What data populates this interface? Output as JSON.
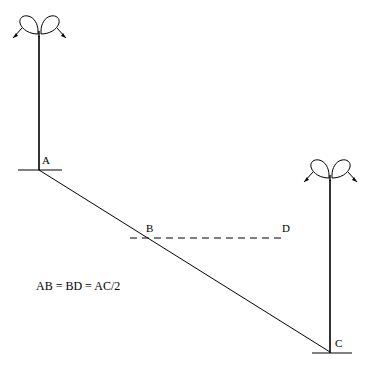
{
  "figure": {
    "type": "geometry-diagram",
    "background_color": "#ffffff",
    "stroke_color": "#000000",
    "equation": "AB = BD = AC/2",
    "points": [
      {
        "id": "A",
        "label": "A",
        "x": 39,
        "y": 169,
        "label_x": 42,
        "label_y": 160
      },
      {
        "id": "B",
        "label": "B",
        "x": 148,
        "y": 237,
        "label_x": 147,
        "label_y": 228
      },
      {
        "id": "C",
        "label": "C",
        "x": 330,
        "y": 352,
        "label_x": 334,
        "label_y": 343
      },
      {
        "id": "D",
        "label": "D",
        "x": 280,
        "y": 237,
        "label_x": 283,
        "label_y": 228
      }
    ],
    "segments": [
      {
        "name": "ground-left",
        "x1": 18,
        "y1": 170,
        "x2": 62,
        "y2": 170,
        "style": "solid"
      },
      {
        "name": "ground-right",
        "x1": 312,
        "y1": 353,
        "x2": 352,
        "y2": 353,
        "style": "solid"
      },
      {
        "name": "line-AC",
        "x1": 39,
        "y1": 170,
        "x2": 330,
        "y2": 352,
        "style": "solid"
      },
      {
        "name": "segment-BD",
        "x1": 130,
        "y1": 238,
        "x2": 281,
        "y2": 238,
        "style": "dashed"
      },
      {
        "name": "pole-left",
        "x1": 39,
        "y1": 36,
        "x2": 39,
        "y2": 170,
        "style": "solid"
      },
      {
        "name": "pole-right",
        "x1": 330,
        "y1": 180,
        "x2": 330,
        "y2": 353,
        "style": "solid"
      }
    ],
    "lamps": [
      {
        "name": "lamp-left",
        "cx": 39,
        "cy": 28
      },
      {
        "name": "lamp-right",
        "cx": 330,
        "cy": 172
      }
    ]
  }
}
